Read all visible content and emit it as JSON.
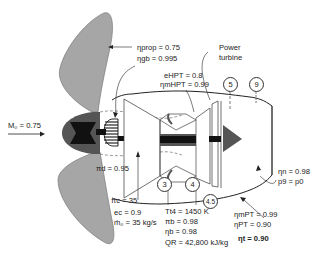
{
  "diagram": {
    "type": "turboprop-engine-schematic",
    "colors": {
      "propeller": "#a6a6a6",
      "hub_outer": "#555555",
      "hub_core": "#111111",
      "shaft": "#111111",
      "shaft_band": "#555555",
      "nozzle_arrow": "#555555",
      "line": "#222222"
    },
    "flight_condition": {
      "label": "M₀ = 0.75"
    },
    "propeller": {
      "eta_prop": "ηprop = 0.75",
      "eta_gb": "ηgb = 0.995"
    },
    "power_turbine_label": {
      "line1": "Power",
      "line2": "turbine"
    },
    "hpt": {
      "e_hpt": "eHPT = 0.8",
      "eta_mhpt": "ηmHPT = 0.99"
    },
    "inlet": {
      "pi_d": "πd = 0.95"
    },
    "compressor": {
      "pi_c": "πc = 35",
      "e_c": "ec = 0.9",
      "mdot": "ṁ₀ = 35 kg/s"
    },
    "burner": {
      "Tt4": "Tt4 = 1450 K",
      "pi_b": "πb = 0.98",
      "eta_b": "ηb = 0.98",
      "QR": "QR = 42,800 kJ/kg"
    },
    "power_turbine": {
      "eta_mpt": "ηmPT = 0.99",
      "eta_pt": "ηPT = 0.90",
      "eta_t": "ηt = 0.90"
    },
    "nozzle": {
      "eta_n": "ηn = 0.98",
      "p9": "p9 = p0"
    },
    "stations": [
      "3",
      "4",
      "4.5",
      "5",
      "9"
    ]
  }
}
